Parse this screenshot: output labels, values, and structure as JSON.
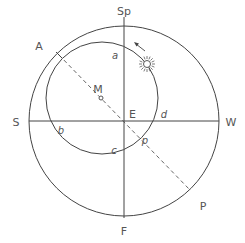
{
  "diagram": {
    "labels": {
      "top": "Sp",
      "bottom": "F",
      "left": "S",
      "right": "W",
      "center": "E",
      "inner_center": "M",
      "dashed_start": "A",
      "dashed_end": "P",
      "dashed_inner_crossing": "p",
      "inner_a": "a",
      "inner_b": "b",
      "inner_c": "c",
      "inner_d": "d"
    },
    "icons": {
      "sun": "sun-icon",
      "motion_arrow": "arrow-icon"
    },
    "colors": {
      "line": "#444444",
      "text": "#555555",
      "background": "#ffffff"
    }
  }
}
